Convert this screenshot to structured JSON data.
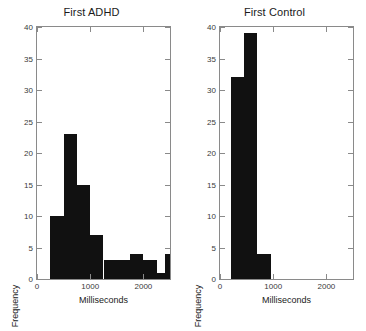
{
  "figure": {
    "background": "#ffffff",
    "bar_color": "#111111",
    "axis_color": "#8a8a8a"
  },
  "panels": [
    {
      "key": "first_adhd",
      "title": "First ADHD",
      "xlabel": "Milliseconds",
      "ylabel": "Frequency",
      "xticks": [
        "0",
        "1000",
        "2000"
      ],
      "yticks": [
        "0",
        "5",
        "10",
        "15",
        "20",
        "25",
        "30",
        "35",
        "40"
      ]
    },
    {
      "key": "first_control",
      "title": "First Control",
      "xlabel": "Milliseconds",
      "ylabel": "Frequency",
      "xticks": [
        "0",
        "1000",
        "2000"
      ],
      "yticks": [
        "0",
        "5",
        "10",
        "15",
        "20",
        "25",
        "30",
        "35",
        "40"
      ]
    }
  ],
  "chart_data": [
    {
      "type": "bar",
      "title": "First ADHD",
      "xlabel": "Milliseconds",
      "ylabel": "Frequency",
      "xlim": [
        0,
        2500
      ],
      "ylim": [
        0,
        40
      ],
      "xtick_values": [
        0,
        1000,
        2000
      ],
      "ytick_values": [
        0,
        5,
        10,
        15,
        20,
        25,
        30,
        35,
        40
      ],
      "grid": false,
      "legend": "none",
      "bin_edges": [
        250,
        500,
        750,
        1000,
        1250,
        1500,
        1750,
        2000,
        2250,
        2500
      ],
      "bin_width": 250,
      "values": [
        10,
        23,
        15,
        7,
        3,
        3,
        4,
        3,
        1,
        4
      ],
      "bins": [
        {
          "range": "250-500",
          "count": 10
        },
        {
          "range": "500-750",
          "count": 23
        },
        {
          "range": "750-1000",
          "count": 15
        },
        {
          "range": "1000-1250",
          "count": 7
        },
        {
          "range": "1250-1500",
          "count": 3
        },
        {
          "range": "1500-1750",
          "count": 3
        },
        {
          "range": "1750-2000",
          "count": 4
        },
        {
          "range": "2000-2250",
          "count": 3
        },
        {
          "range": "2250-2400",
          "count": 1
        },
        {
          "range": "2400-2500",
          "count": 4
        }
      ]
    },
    {
      "type": "bar",
      "title": "First Control",
      "xlabel": "Milliseconds",
      "ylabel": "Frequency",
      "xlim": [
        0,
        2500
      ],
      "ylim": [
        0,
        40
      ],
      "xtick_values": [
        0,
        1000,
        2000
      ],
      "ytick_values": [
        0,
        5,
        10,
        15,
        20,
        25,
        30,
        35,
        40
      ],
      "grid": false,
      "legend": "none",
      "bin_edges": [
        200,
        450,
        700,
        950
      ],
      "bin_width": 250,
      "values": [
        32,
        39,
        4
      ],
      "bins": [
        {
          "range": "200-450",
          "count": 32
        },
        {
          "range": "450-700",
          "count": 39
        },
        {
          "range": "700-950",
          "count": 4
        }
      ]
    }
  ]
}
